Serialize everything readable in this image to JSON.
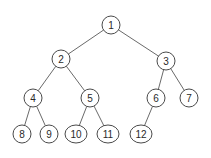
{
  "diagram": {
    "type": "binary-tree",
    "colors": {
      "node_stroke": "#4a4a4a",
      "edge": "#6a6a6a",
      "text": "#2a2a2a",
      "background": "#ffffff"
    },
    "nodes": [
      {
        "id": "1",
        "label": "1",
        "x": 111,
        "y": 25,
        "rx": 9,
        "ry": 9
      },
      {
        "id": "2",
        "label": "2",
        "x": 61,
        "y": 59,
        "rx": 9,
        "ry": 9
      },
      {
        "id": "3",
        "label": "3",
        "x": 166,
        "y": 61,
        "rx": 9,
        "ry": 9
      },
      {
        "id": "4",
        "label": "4",
        "x": 33,
        "y": 98,
        "rx": 9,
        "ry": 9
      },
      {
        "id": "5",
        "label": "5",
        "x": 90,
        "y": 98,
        "rx": 9,
        "ry": 9
      },
      {
        "id": "6",
        "label": "6",
        "x": 156,
        "y": 98,
        "rx": 9,
        "ry": 9
      },
      {
        "id": "7",
        "label": "7",
        "x": 189,
        "y": 98,
        "rx": 9,
        "ry": 9
      },
      {
        "id": "8",
        "label": "8",
        "x": 22,
        "y": 134,
        "rx": 9,
        "ry": 9
      },
      {
        "id": "9",
        "label": "9",
        "x": 49,
        "y": 134,
        "rx": 9,
        "ry": 9
      },
      {
        "id": "10",
        "label": "10",
        "x": 76,
        "y": 134,
        "rx": 11,
        "ry": 9
      },
      {
        "id": "11",
        "label": "11",
        "x": 108,
        "y": 134,
        "rx": 11,
        "ry": 9
      },
      {
        "id": "12",
        "label": "12",
        "x": 141,
        "y": 134,
        "rx": 11,
        "ry": 9
      }
    ],
    "edges": [
      [
        "1",
        "2"
      ],
      [
        "1",
        "3"
      ],
      [
        "2",
        "4"
      ],
      [
        "2",
        "5"
      ],
      [
        "3",
        "6"
      ],
      [
        "3",
        "7"
      ],
      [
        "4",
        "8"
      ],
      [
        "4",
        "9"
      ],
      [
        "5",
        "10"
      ],
      [
        "5",
        "11"
      ],
      [
        "6",
        "12"
      ]
    ]
  }
}
